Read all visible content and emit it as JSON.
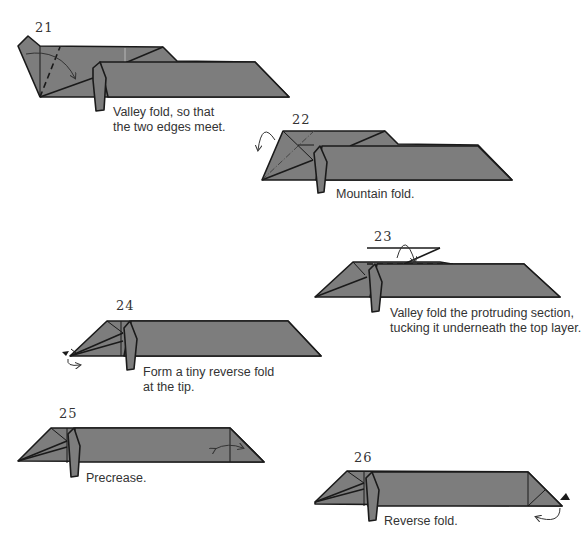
{
  "steps": [
    {
      "number": "21",
      "caption_line1": "Valley fold, so that",
      "caption_line2": "the two edges meet."
    },
    {
      "number": "22",
      "caption_line1": "Mountain fold.",
      "caption_line2": ""
    },
    {
      "number": "23",
      "caption_line1": "Valley fold the protruding section,",
      "caption_line2": "tucking it underneath the top layer."
    },
    {
      "number": "24",
      "caption_line1": "Form a tiny reverse fold",
      "caption_line2": "at the tip."
    },
    {
      "number": "25",
      "caption_line1": "Precrease.",
      "caption_line2": ""
    },
    {
      "number": "26",
      "caption_line1": "Reverse fold.",
      "caption_line2": ""
    }
  ],
  "colors": {
    "paper": "#7d7d7d",
    "line": "#1a1a1a",
    "background": "#ffffff"
  }
}
